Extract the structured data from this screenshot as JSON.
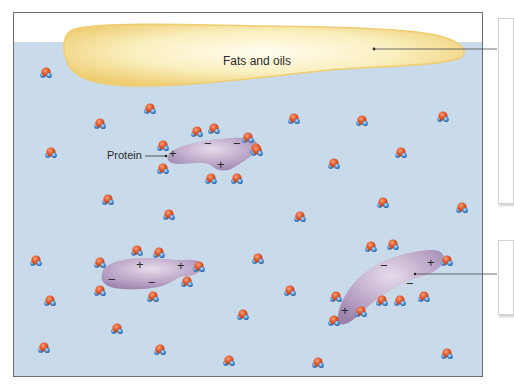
{
  "figure": {
    "labels": {
      "fats": "Fats and oils",
      "protein": "Protein"
    },
    "colors": {
      "water_bg": "#c9daea",
      "frame": "#6e6e6e",
      "fat_fill": "#f7e7a6",
      "fat_edge": "#ecc96a",
      "protein_fill": "#b9a3c6",
      "oxygen": "#e0582c",
      "hydrogen": "#4a8fd0"
    },
    "charges": {
      "plus": "+",
      "minus": "−"
    },
    "callouts": [
      {
        "name": "fats-callout",
        "x": 498,
        "y": 18,
        "w": 14,
        "h": 184
      },
      {
        "name": "protein-callout",
        "x": 498,
        "y": 240,
        "w": 14,
        "h": 73
      }
    ]
  }
}
